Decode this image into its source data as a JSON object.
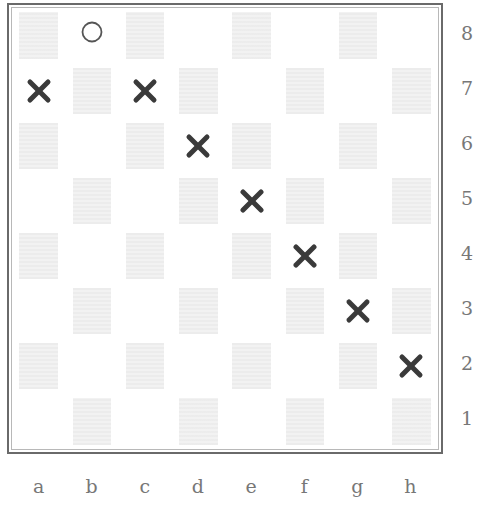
{
  "board": {
    "files": [
      "a",
      "b",
      "c",
      "d",
      "e",
      "f",
      "g",
      "h"
    ],
    "ranks": [
      "8",
      "7",
      "6",
      "5",
      "4",
      "3",
      "2",
      "1"
    ],
    "shading": "a1 dark (standard chessboard pattern, dark squares lightly textured)",
    "colors": {
      "frame": "#6a6a6a",
      "light_square": "#ffffff",
      "dark_square": "#f2f2f2",
      "cross_marker": "#3a3a3a",
      "circle_marker": "#555555",
      "label_text": "#777777"
    },
    "markers": [
      {
        "square": "b8",
        "type": "circle"
      },
      {
        "square": "a7",
        "type": "cross"
      },
      {
        "square": "c7",
        "type": "cross"
      },
      {
        "square": "d6",
        "type": "cross"
      },
      {
        "square": "e5",
        "type": "cross"
      },
      {
        "square": "f4",
        "type": "cross"
      },
      {
        "square": "g3",
        "type": "cross"
      },
      {
        "square": "h2",
        "type": "cross"
      }
    ]
  },
  "labels": {
    "rank_labels": [
      "8",
      "7",
      "6",
      "5",
      "4",
      "3",
      "2",
      "1"
    ],
    "file_labels": [
      "a",
      "b",
      "c",
      "d",
      "e",
      "f",
      "g",
      "h"
    ]
  },
  "icons": {
    "cross": "cross-mark-icon (bold X)",
    "circle": "circle-mark-icon (hollow ring)"
  }
}
